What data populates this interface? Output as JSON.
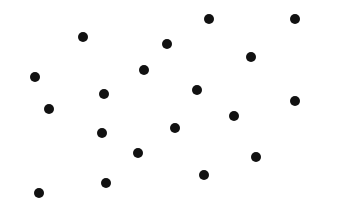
{
  "canvas": {
    "width": 345,
    "height": 215,
    "background": "#ffffff",
    "dot_color": "#111111",
    "dot_diameter": 10
  },
  "dots": [
    {
      "x": 83,
      "y": 37
    },
    {
      "x": 209,
      "y": 19
    },
    {
      "x": 295,
      "y": 19
    },
    {
      "x": 167,
      "y": 44
    },
    {
      "x": 251,
      "y": 57
    },
    {
      "x": 35,
      "y": 77
    },
    {
      "x": 144,
      "y": 70
    },
    {
      "x": 197,
      "y": 90
    },
    {
      "x": 49,
      "y": 109
    },
    {
      "x": 104,
      "y": 94
    },
    {
      "x": 295,
      "y": 101
    },
    {
      "x": 234,
      "y": 116
    },
    {
      "x": 102,
      "y": 133
    },
    {
      "x": 175,
      "y": 128
    },
    {
      "x": 138,
      "y": 153
    },
    {
      "x": 256,
      "y": 157
    },
    {
      "x": 204,
      "y": 175
    },
    {
      "x": 106,
      "y": 183
    },
    {
      "x": 39,
      "y": 193
    }
  ],
  "dot_count": 19
}
